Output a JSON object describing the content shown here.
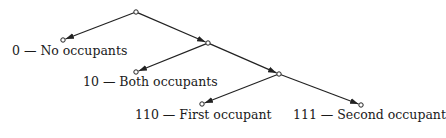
{
  "diagram": {
    "type": "binary-tree",
    "nodes": [
      {
        "id": "root",
        "x": 136,
        "y": 12
      },
      {
        "id": "n0",
        "x": 63,
        "y": 40
      },
      {
        "id": "n1",
        "x": 208,
        "y": 43
      },
      {
        "id": "n10",
        "x": 136,
        "y": 72
      },
      {
        "id": "n11",
        "x": 279,
        "y": 74
      },
      {
        "id": "n110",
        "x": 202,
        "y": 104
      },
      {
        "id": "n111",
        "x": 361,
        "y": 105
      }
    ],
    "edges": [
      {
        "from": "root",
        "to": "n0"
      },
      {
        "from": "root",
        "to": "n1"
      },
      {
        "from": "n1",
        "to": "n10"
      },
      {
        "from": "n1",
        "to": "n11"
      },
      {
        "from": "n11",
        "to": "n110"
      },
      {
        "from": "n11",
        "to": "n111"
      }
    ],
    "labels": [
      {
        "id": "label-0",
        "text": "0 — No occupants",
        "x": 12,
        "y": 52
      },
      {
        "id": "label-10",
        "text": "10 — Both occupants",
        "x": 83,
        "y": 82
      },
      {
        "id": "label-110",
        "text": "110 — First occupant",
        "x": 135,
        "y": 116
      },
      {
        "id": "label-111",
        "text": "111 — Second occupant",
        "x": 293,
        "y": 116
      }
    ]
  }
}
